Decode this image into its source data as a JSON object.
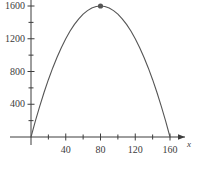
{
  "chart_data": {
    "type": "line",
    "title": "",
    "xlabel": "x",
    "ylabel": "",
    "xlim": [
      -10,
      178
    ],
    "ylim": [
      -120,
      1760
    ],
    "grid": false,
    "legend": null,
    "function": "y = 40x - 0.25x^2",
    "x_ticks_major": [
      40,
      80,
      120,
      160
    ],
    "x_tick_labels": [
      "40",
      "80",
      "120",
      "160"
    ],
    "x_ticks_minor": [
      20,
      60,
      100,
      140
    ],
    "y_ticks_major": [
      400,
      800,
      1200,
      1600
    ],
    "y_tick_labels": [
      "400",
      "800",
      "1200",
      "1600"
    ],
    "y_ticks_minor": [
      200,
      600,
      1000,
      1400
    ],
    "x": [
      0,
      5,
      10,
      15,
      20,
      25,
      30,
      35,
      40,
      45,
      50,
      55,
      60,
      65,
      70,
      75,
      80,
      85,
      90,
      95,
      100,
      105,
      110,
      115,
      120,
      125,
      130,
      135,
      140,
      145,
      150,
      155,
      160
    ],
    "values": [
      0,
      193.75,
      375,
      543.75,
      700,
      843.75,
      975,
      1093.75,
      1200,
      1293.75,
      1375,
      1443.75,
      1500,
      1543.75,
      1575,
      1593.75,
      1600,
      1593.75,
      1575,
      1543.75,
      1500,
      1443.75,
      1375,
      1293.75,
      1200,
      1093.75,
      975,
      843.75,
      700,
      543.75,
      375,
      193.75,
      0
    ],
    "markers": [
      {
        "name": "vertex",
        "x": 80,
        "y": 1600,
        "label": ""
      }
    ],
    "colors": {
      "curve": "#555555",
      "axis": "#3c3c3c",
      "marker": "#555555",
      "text": "#3c3c3c",
      "background": "#ffffff"
    }
  }
}
